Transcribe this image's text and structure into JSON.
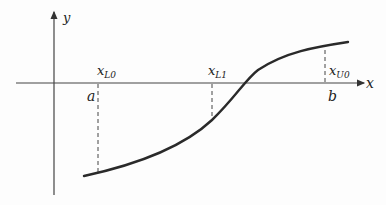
{
  "diagram": {
    "axes": {
      "x_label": "x",
      "y_label": "y"
    },
    "labels": {
      "x_L0": {
        "main": "x",
        "sub": "L0"
      },
      "x_L1": {
        "main": "x",
        "sub": "L1"
      },
      "x_U0": {
        "main": "x",
        "sub": "U0"
      },
      "a": "a",
      "b": "b"
    },
    "colors": {
      "axis": "#333333",
      "curve": "#2a2a2a",
      "dash": "#333333",
      "background": "#fdfdfd"
    }
  }
}
